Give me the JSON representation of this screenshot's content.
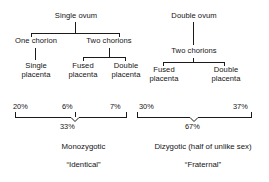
{
  "diagram": {
    "line_color": "#1a1a1a",
    "text_color": "#141414",
    "background": "#ffffff"
  },
  "left_tree": {
    "root": "Single ovum",
    "level2": [
      "One chorion",
      "Two chorions"
    ],
    "level3": [
      {
        "line1": "Single",
        "line2": "placenta"
      },
      {
        "line1": "Fused",
        "line2": "placenta"
      },
      {
        "line1": "Double",
        "line2": "placenta"
      }
    ]
  },
  "right_tree": {
    "root": "Double ovum",
    "level2": [
      "Two chorions"
    ],
    "level3": [
      {
        "line1": "Fused",
        "line2": "placenta"
      },
      {
        "line1": "Double",
        "line2": "placenta"
      }
    ]
  },
  "percentages": {
    "left": [
      "20%",
      "6%",
      "7%"
    ],
    "left_total": "33%",
    "right": [
      "30%",
      "37%"
    ],
    "right_total": "67%"
  },
  "captions": {
    "left_name": "Monozygotic",
    "left_alias": "“Identical”",
    "right_name": "Dizygotic (half of unlike sex)",
    "right_alias": "“Fraternal”"
  }
}
